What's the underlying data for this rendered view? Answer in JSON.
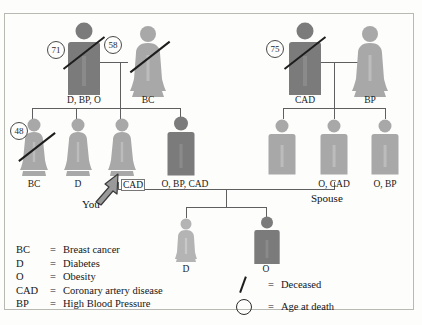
{
  "diagram": {
    "colors": {
      "affected_dark": "#7b7b7b",
      "unaffected_light": "#a8a8a8",
      "line": "#5f5f5f",
      "slash": "#1d1d1d",
      "text": "#1a1a1a",
      "frame": "#b9b9b4",
      "background": "#fdfdfc"
    },
    "generation1": [
      {
        "id": "grandfather-maternal",
        "sex": "male",
        "shade": "dark",
        "deceased": true,
        "age_at_death": "71",
        "conditions_label": "D, BP, O"
      },
      {
        "id": "grandmother-maternal",
        "sex": "female",
        "shade": "light",
        "deceased": true,
        "age_at_death": "58",
        "conditions_label": "BC"
      },
      {
        "id": "grandfather-paternal",
        "sex": "male",
        "shade": "dark",
        "deceased": true,
        "age_at_death": "75",
        "conditions_label": "CAD"
      },
      {
        "id": "grandmother-paternal",
        "sex": "female",
        "shade": "light",
        "deceased": false,
        "age_at_death": "",
        "conditions_label": "BP"
      }
    ],
    "generation2": [
      {
        "id": "sibling-1",
        "sex": "female",
        "shade": "light",
        "deceased": true,
        "age_at_death": "48",
        "conditions_label": "BC"
      },
      {
        "id": "sibling-2",
        "sex": "female",
        "shade": "light",
        "deceased": false,
        "age_at_death": "",
        "conditions_label": "D"
      },
      {
        "id": "proband-you",
        "sex": "female",
        "shade": "light",
        "deceased": false,
        "age_at_death": "",
        "conditions_label": "CAD"
      },
      {
        "id": "sibling-4",
        "sex": "male",
        "shade": "dark",
        "deceased": false,
        "age_at_death": "",
        "conditions_label": "O, BP, CAD"
      },
      {
        "id": "in-law-1",
        "sex": "male",
        "shade": "light",
        "deceased": false,
        "age_at_death": "",
        "conditions_label": ""
      },
      {
        "id": "spouse",
        "sex": "male",
        "shade": "light",
        "deceased": false,
        "age_at_death": "",
        "conditions_label": "O, CAD"
      },
      {
        "id": "in-law-3",
        "sex": "male",
        "shade": "light",
        "deceased": false,
        "age_at_death": "",
        "conditions_label": "O, BP"
      }
    ],
    "generation3": [
      {
        "id": "child-daughter",
        "sex": "female",
        "shade": "light",
        "deceased": false,
        "age_at_death": "",
        "conditions_label": "D"
      },
      {
        "id": "child-son",
        "sex": "male",
        "shade": "dark",
        "deceased": false,
        "age_at_death": "",
        "conditions_label": "O"
      }
    ],
    "annotations": {
      "you": "You",
      "spouse": "Spouse"
    },
    "legend_abbreviations": [
      {
        "key": "BC",
        "eq": "=",
        "value": "Breast cancer"
      },
      {
        "key": "D",
        "eq": "=",
        "value": "Diabetes"
      },
      {
        "key": "O",
        "eq": "=",
        "value": "Obesity"
      },
      {
        "key": "CAD",
        "eq": "=",
        "value": "Coronary artery disease"
      },
      {
        "key": "BP",
        "eq": "=",
        "value": "High Blood Pressure"
      }
    ],
    "legend_symbols": [
      {
        "symbol": "slash",
        "eq": "=",
        "value": "Deceased"
      },
      {
        "symbol": "circle",
        "eq": "=",
        "value": "Age at death"
      }
    ]
  }
}
